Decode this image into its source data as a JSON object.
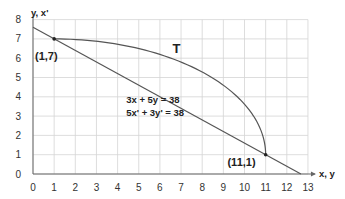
{
  "chart_data": {
    "type": "line",
    "title": "",
    "xlabel": "x, y",
    "ylabel": "y, x'",
    "xlim": [
      0,
      13
    ],
    "ylim": [
      0,
      8
    ],
    "x_ticks": [
      "0",
      "1",
      "2",
      "3",
      "4",
      "5",
      "6",
      "7",
      "8",
      "9",
      "10",
      "11",
      "12",
      "13"
    ],
    "y_ticks": [
      "0",
      "1",
      "2",
      "3",
      "4",
      "5",
      "6",
      "7",
      "8"
    ],
    "grid": true,
    "series": [
      {
        "name": "3x + 5y = 38",
        "kind": "line",
        "points": [
          [
            0,
            7.6
          ],
          [
            12.667,
            0
          ]
        ],
        "color": "#555555"
      },
      {
        "name": "T",
        "kind": "curve",
        "description": "quarter-ellipse arc centered at (1,1) from (1,7) to (11,1)",
        "center": [
          1,
          1
        ],
        "semi_axes": [
          10,
          6
        ],
        "points": [
          [
            1,
            7
          ],
          [
            3,
            6.88
          ],
          [
            5,
            6.5
          ],
          [
            7,
            5.8
          ],
          [
            9,
            4.6
          ],
          [
            10,
            3.62
          ],
          [
            10.7,
            2.46
          ],
          [
            11,
            1
          ]
        ],
        "color": "#555555"
      }
    ],
    "markers": [
      {
        "label": "(1,7)",
        "x": 1,
        "y": 7
      },
      {
        "label": "(11,1)",
        "x": 11,
        "y": 1
      }
    ],
    "annotations": [
      {
        "text": "T",
        "x": 6.6,
        "y": 6.5
      },
      {
        "text": "3x + 5y = 38",
        "x": 4.5,
        "y": 3.7
      },
      {
        "text": "5x' + 3y' = 38",
        "x": 4.5,
        "y": 3.1
      }
    ],
    "colors": {
      "line": "#555555",
      "grid": "#d4d4d4",
      "axis": "#666666",
      "text": "#222222"
    }
  }
}
